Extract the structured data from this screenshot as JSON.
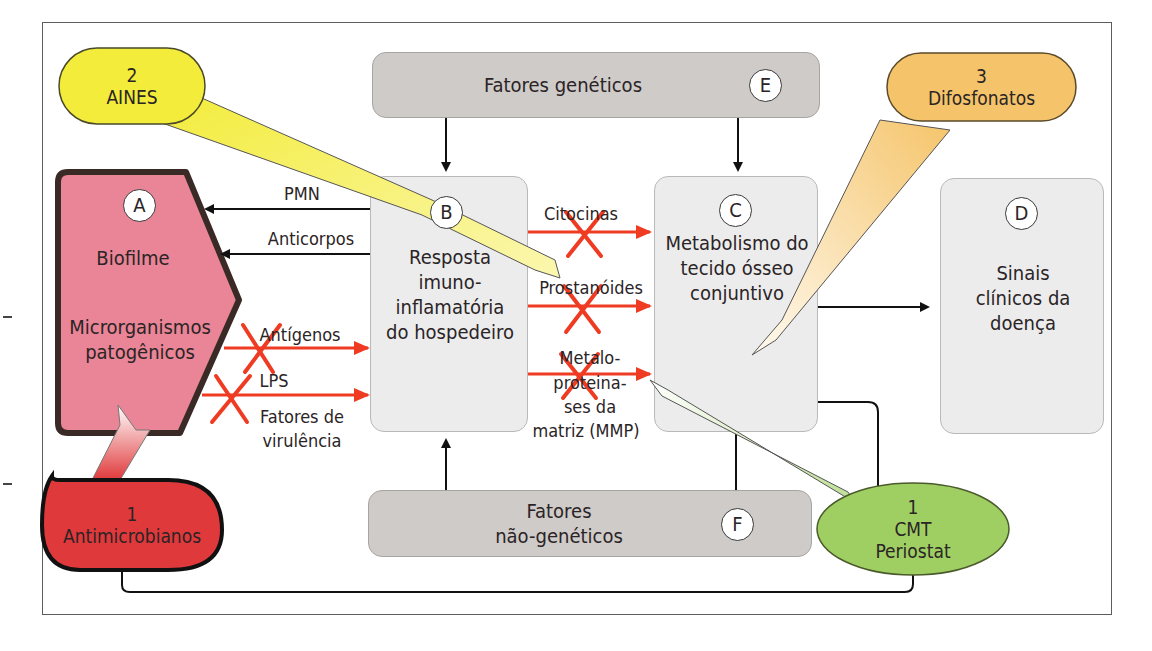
{
  "figure": {
    "nodes": {
      "A": {
        "marker": "A",
        "title": "Biofilme",
        "subtitle_line1": "Microrganismos",
        "subtitle_line2": "patogênicos",
        "fill": "#e98596",
        "border": "#3a2a26"
      },
      "B": {
        "marker": "B",
        "lines": [
          "Resposta",
          "imuno-",
          "inflamatória",
          "do hospedeiro"
        ]
      },
      "C": {
        "marker": "C",
        "lines": [
          "Metabolismo do",
          "tecido ósseo",
          "conjuntivo"
        ]
      },
      "D": {
        "marker": "D",
        "lines": [
          "Sinais",
          "clínicos da",
          "doença"
        ]
      },
      "E": {
        "marker": "E",
        "label": "Fatores genéticos"
      },
      "F": {
        "marker": "F",
        "line1": "Fatores",
        "line2": "não-genéticos"
      }
    },
    "arrows_from_B_to_A": [
      {
        "label": "PMN"
      },
      {
        "label": "Anticorpos"
      }
    ],
    "arrows_from_A_to_B": [
      {
        "label": "Antígenos",
        "blocked": true
      },
      {
        "label_top": "LPS",
        "label_bottom_1": "Fatores de",
        "label_bottom_2": "virulência",
        "blocked": true
      }
    ],
    "arrows_from_B_to_C": [
      {
        "label": "Citocinas",
        "blocked": true
      },
      {
        "label": "Prostanóides",
        "blocked": true
      },
      {
        "line1": "Metalo-",
        "line2": "proteina-",
        "line3": "ses da",
        "line4": "matriz (MMP)",
        "blocked": true
      }
    ],
    "therapies": [
      {
        "number": "1",
        "name": "Antimicrobianos",
        "color": "#e0393b",
        "target": "A"
      },
      {
        "number": "2",
        "name": "AINES",
        "color": "#f3ec3a",
        "target": "Prostanóides"
      },
      {
        "number": "3",
        "name": "Difosfonatos",
        "color": "#f5c46a",
        "target": "C"
      },
      {
        "number": "1",
        "name_line1": "CMT",
        "name_line2": "Periostat",
        "color": "#9fcf63",
        "target": "MMP"
      }
    ],
    "colors": {
      "blocked_arrow": "#ef3b22",
      "box_light": "#ececec",
      "box_dark": "#cfcbc8"
    }
  }
}
